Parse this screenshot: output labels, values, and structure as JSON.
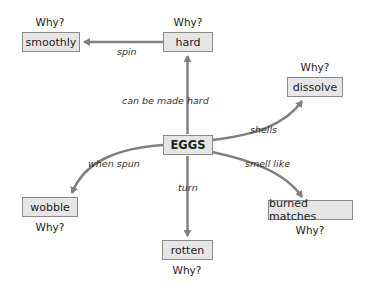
{
  "diagram": {
    "center": {
      "label": "EGGS"
    },
    "why_label": "Why?",
    "nodes": [
      {
        "id": "hard",
        "label": "hard",
        "why": "Why?"
      },
      {
        "id": "smoothly",
        "label": "smoothly",
        "why": "Why?"
      },
      {
        "id": "dissolve",
        "label": "dissolve",
        "why": "Why?"
      },
      {
        "id": "wobble",
        "label": "wobble",
        "why": "Why?"
      },
      {
        "id": "burned_matches",
        "label": "burned matches",
        "why": "Why?"
      },
      {
        "id": "rotten",
        "label": "rotten",
        "why": "Why?"
      }
    ],
    "edges": [
      {
        "from": "EGGS",
        "to": "hard",
        "label": "can be made hard"
      },
      {
        "from": "hard",
        "to": "smoothly",
        "label": "spin"
      },
      {
        "from": "EGGS",
        "to": "dissolve",
        "label": "shells"
      },
      {
        "from": "EGGS",
        "to": "wobble",
        "label": "when spun"
      },
      {
        "from": "EGGS",
        "to": "burned_matches",
        "label": "smell like"
      },
      {
        "from": "EGGS",
        "to": "rotten",
        "label": "turn"
      }
    ],
    "colors": {
      "box_fill": "#e6e6e6",
      "box_border": "#8a8a8a",
      "arrow": "#808080"
    }
  }
}
